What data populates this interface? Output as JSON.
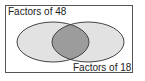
{
  "diagram": {
    "type": "venn",
    "sets": [
      {
        "id": "A",
        "label": "Factors of 48",
        "fill": "#e2e2e2",
        "stroke": "#444444"
      },
      {
        "id": "B",
        "label": "Factors of 18",
        "fill": "#e2e2e2",
        "stroke": "#444444"
      }
    ],
    "intersection": {
      "fill": "#9c9c9c",
      "shaded": true
    },
    "frame_stroke": "#555555"
  }
}
